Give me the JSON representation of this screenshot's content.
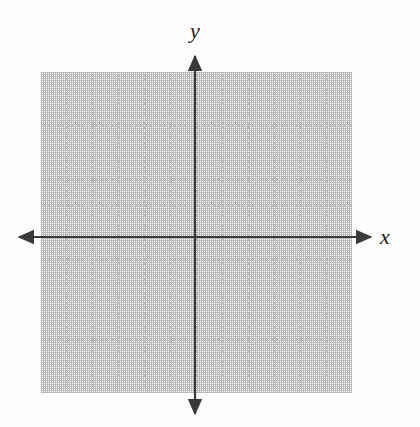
{
  "figure": {
    "width": 420,
    "height": 427,
    "background_color": "#fdfdfd"
  },
  "axes": {
    "x_label": "x",
    "y_label": "y",
    "axis_color": "#3a3a3a",
    "axis_width_px": 2,
    "origin": {
      "x": 195,
      "y": 237
    },
    "x_axis": {
      "start_x": 18,
      "end_x": 372,
      "y": 237,
      "arrows": "both"
    },
    "y_axis": {
      "x": 195,
      "start_y": 55,
      "end_y": 415,
      "arrows": "both"
    }
  },
  "grid": {
    "color": "#b9b9b9",
    "style": "dotted",
    "left": 41,
    "top": 72,
    "width": 311,
    "height": 321,
    "columns": 12,
    "rows": 12,
    "cell_width": 25.92,
    "cell_height": 26.75
  },
  "chart_data": {
    "type": "scatter",
    "title": "",
    "xlabel": "x",
    "ylabel": "y",
    "xlim": [
      -6,
      6
    ],
    "ylim": [
      -6,
      6
    ],
    "xticks": [
      -6,
      -5,
      -4,
      -3,
      -2,
      -1,
      0,
      1,
      2,
      3,
      4,
      5,
      6
    ],
    "yticks": [
      -6,
      -5,
      -4,
      -3,
      -2,
      -1,
      0,
      1,
      2,
      3,
      4,
      5,
      6
    ],
    "tick_labels_shown": false,
    "grid": true,
    "grid_style": "dotted",
    "legend": null,
    "series": [],
    "x": [],
    "y": [],
    "annotations": []
  }
}
